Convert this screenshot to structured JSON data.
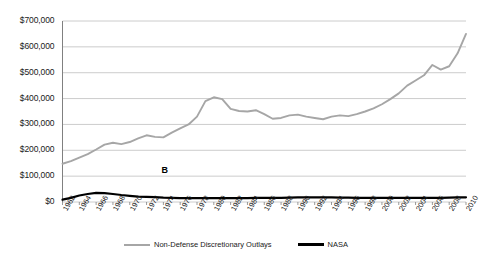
{
  "chart_data": {
    "type": "line",
    "title": "",
    "xlabel": "",
    "ylabel": "",
    "grid": true,
    "legend_position": "bottom-center",
    "xlim": [
      1962,
      2010
    ],
    "ylim": [
      0,
      700000
    ],
    "yticks": [
      0,
      100000,
      200000,
      300000,
      400000,
      500000,
      600000,
      700000
    ],
    "ytick_labels": [
      "$0",
      "$100,000",
      "$200,000",
      "$300,000",
      "$400,000",
      "$500,000",
      "$600,000",
      "$700,000"
    ],
    "x": [
      1962,
      1963,
      1964,
      1965,
      1966,
      1967,
      1968,
      1969,
      1970,
      1971,
      1972,
      1973,
      1974,
      1975,
      1976,
      1977,
      1978,
      1979,
      1980,
      1981,
      1982,
      1983,
      1984,
      1985,
      1986,
      1987,
      1988,
      1989,
      1990,
      1991,
      1992,
      1993,
      1994,
      1995,
      1996,
      1997,
      1998,
      1999,
      2000,
      2001,
      2002,
      2003,
      2004,
      2005,
      2006,
      2007,
      2008,
      2009,
      2010
    ],
    "xtick_labels": [
      "1962",
      "1964",
      "1966",
      "1968",
      "1970",
      "1972",
      "1974",
      "1976",
      "1978",
      "1980",
      "1982",
      "1984",
      "1986",
      "1988",
      "1990",
      "1992",
      "1994",
      "1996",
      "1998",
      "2000",
      "2002",
      "2004",
      "2006",
      "2008",
      "2010"
    ],
    "xticks": [
      1962,
      1964,
      1966,
      1968,
      1970,
      1972,
      1974,
      1976,
      1978,
      1980,
      1982,
      1984,
      1986,
      1988,
      1990,
      1992,
      1994,
      1996,
      1998,
      2000,
      2002,
      2004,
      2006,
      2008,
      2010
    ],
    "series": [
      {
        "name": "Non-Defense Discretionary Outlays",
        "color": "#a6a6a6",
        "values": [
          148000,
          158000,
          172000,
          185000,
          203000,
          222000,
          229000,
          224000,
          232000,
          246000,
          258000,
          252000,
          250000,
          268000,
          285000,
          300000,
          330000,
          390000,
          405000,
          398000,
          360000,
          352000,
          350000,
          355000,
          340000,
          322000,
          325000,
          335000,
          338000,
          330000,
          325000,
          320000,
          330000,
          335000,
          332000,
          340000,
          350000,
          362000,
          378000,
          398000,
          420000,
          450000,
          470000,
          490000,
          530000,
          512000,
          525000,
          575000,
          650000
        ]
      },
      {
        "name": "NASA",
        "color": "#000000",
        "values": [
          9000,
          16000,
          25000,
          31000,
          35000,
          34000,
          31000,
          27000,
          24000,
          21000,
          20000,
          19000,
          17000,
          16000,
          15000,
          15000,
          15000,
          15000,
          15000,
          15000,
          15000,
          15000,
          15000,
          16000,
          16000,
          16000,
          16000,
          17000,
          18000,
          18000,
          18000,
          18000,
          18000,
          17000,
          17000,
          16000,
          16000,
          16000,
          16000,
          16000,
          16000,
          16000,
          16000,
          16000,
          16000,
          16000,
          17000,
          18000,
          18000
        ]
      }
    ],
    "annotations": [
      {
        "label": "B",
        "x": 1974,
        "y": 100000
      }
    ]
  },
  "legend": {
    "entries": [
      {
        "label": "Non-Defense Discretionary Outlays"
      },
      {
        "label": "NASA"
      }
    ]
  }
}
